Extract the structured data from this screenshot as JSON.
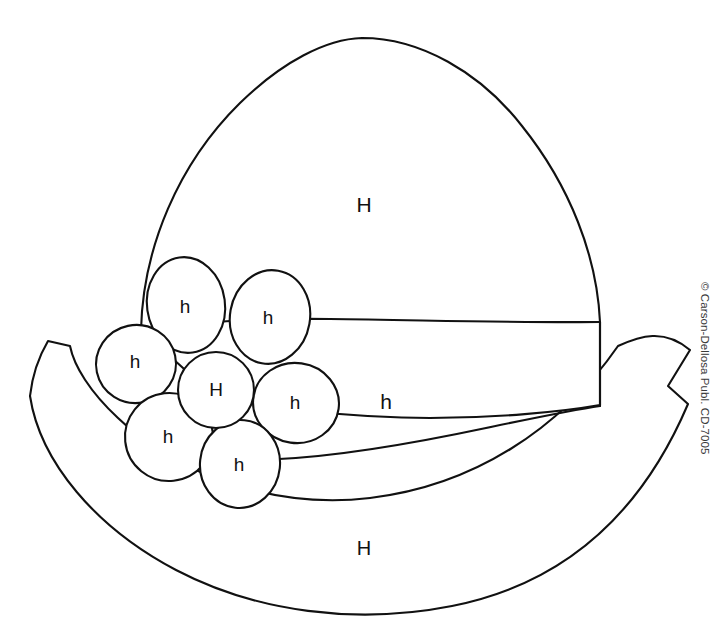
{
  "page": {
    "background_color": "#ffffff",
    "ink_color": "#111111",
    "width": 715,
    "height": 625
  },
  "artwork": {
    "subject": "hat-with-flower",
    "style": "black-and-white line drawing pattern"
  },
  "labels": {
    "crown": "H",
    "band": "h",
    "brim": "H",
    "flower_center": "H",
    "petal_top_left": "h",
    "petal_top_right": "h",
    "petal_left": "h",
    "petal_right": "h",
    "petal_bottom_left": "h",
    "petal_bottom": "h"
  },
  "footer": {
    "copyright": "© Carson-Dellosa Publ. CD-7005"
  }
}
